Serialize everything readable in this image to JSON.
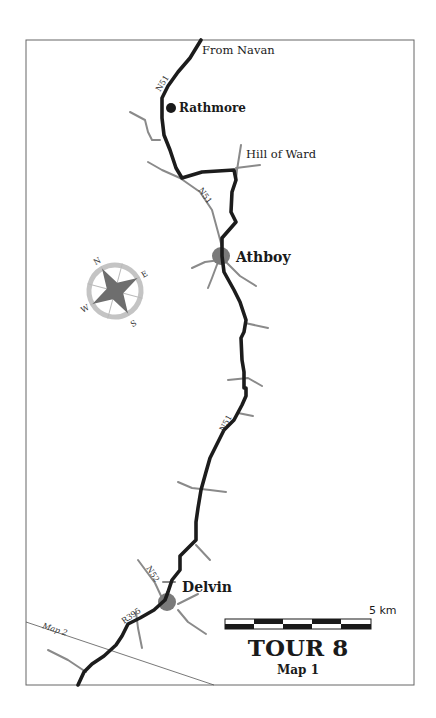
{
  "map": {
    "title": "TOUR 8",
    "subtitle": "Map 1",
    "scale_label": "5 km",
    "places": {
      "from_navan": "From Navan",
      "rathmore": "Rathmore",
      "hill_of_ward": "Hill of Ward",
      "athboy": "Athboy",
      "delvin": "Delvin"
    },
    "road_labels": {
      "n51_top": "N51",
      "n51_middle": "N51",
      "n51_lower": "N51",
      "n52": "N52",
      "r395": "R395"
    },
    "map_link_label": "Map 2",
    "compass": {
      "n": "N",
      "e": "E",
      "s": "S",
      "w": "W"
    },
    "colors": {
      "main_road": "#1c1c1c",
      "minor_road": "#8a8a8a",
      "town_marker": "#7a7a7a",
      "frame": "#666666"
    }
  }
}
